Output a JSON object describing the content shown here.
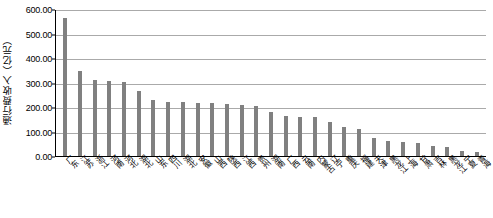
{
  "chart_data": {
    "type": "bar",
    "title": "",
    "xlabel": "",
    "ylabel": "通行费收入（亿元）",
    "ylim": [
      0,
      600
    ],
    "grid": true,
    "legend": "none",
    "ytick_labels": [
      "600.00",
      "500.00",
      "400.00",
      "300.00",
      "200.00",
      "100.00",
      "0.00"
    ],
    "ytick_values": [
      600,
      500,
      400,
      300,
      200,
      100,
      0
    ],
    "categories": [
      "广东",
      "江苏",
      "浙江",
      "河南",
      "河北",
      "湖北",
      "山东",
      "四川",
      "湖北",
      "安徽",
      "山西",
      "陕西",
      "江西",
      "贵州",
      "湖南",
      "广西",
      "云南",
      "内蒙古",
      "辽宁",
      "重庆",
      "福建",
      "天津",
      "黑龙江",
      "上海",
      "甘肃",
      "吉林",
      "黑龙江",
      "宁夏",
      "青海"
    ],
    "values": [
      565,
      348,
      312,
      305,
      302,
      265,
      228,
      222,
      220,
      218,
      215,
      212,
      210,
      205,
      178,
      165,
      160,
      158,
      138,
      120,
      112,
      72,
      62,
      58,
      55,
      42,
      38,
      22,
      18
    ]
  },
  "axis": {
    "y_title": "通行费收入（亿元）"
  },
  "style": {
    "bar_color": "#808080",
    "grid_color": "#aaaaaa",
    "axis_color": "#000000",
    "background": "#ffffff"
  }
}
